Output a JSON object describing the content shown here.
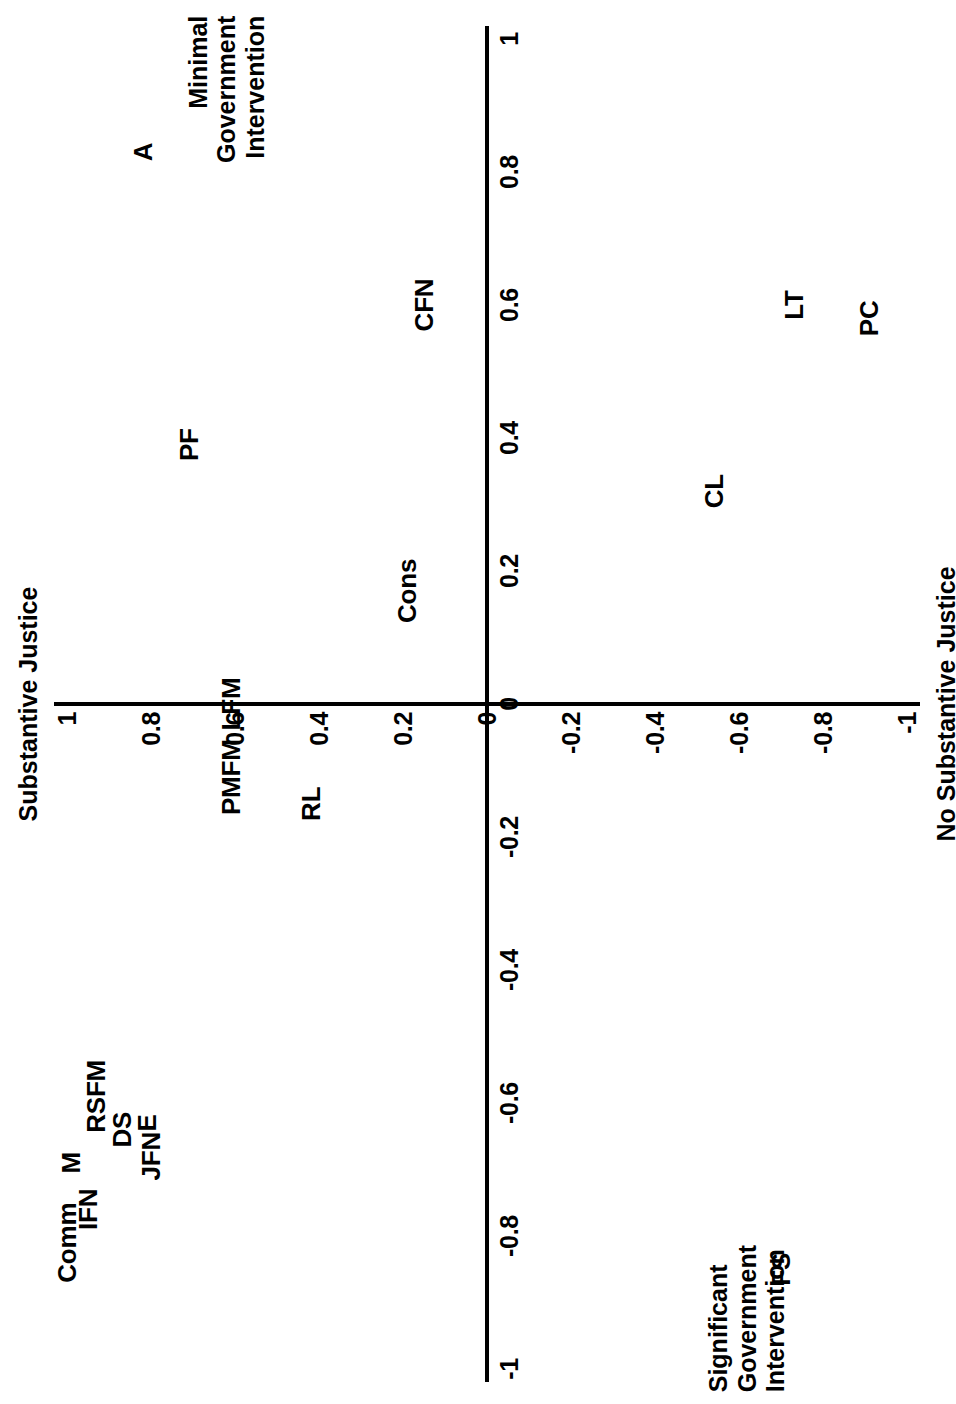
{
  "chart_data": {
    "type": "scatter",
    "title": "",
    "xlabel": "Government Intervention",
    "ylabel": "Substantive Justice",
    "xlim": [
      -1,
      1
    ],
    "ylim": [
      -1,
      1
    ],
    "grid": false,
    "legend": "none",
    "orientation": "page rotated 90 degrees counter-clockwise",
    "axis_titles": {
      "y_positive": "Substantive Justice",
      "y_negative": "No Substantive Justice",
      "x_positive": "Minimal\nGovernment\nIntervention",
      "x_negative": "Significant\nGovernment\nIntervention"
    },
    "x_ticks": [
      "-1",
      "-0.8",
      "-0.6",
      "-0.4",
      "-0.2",
      "0",
      "0.2",
      "0.4",
      "0.6",
      "0.8",
      "1"
    ],
    "x_tick_values": [
      -1,
      -0.8,
      -0.6,
      -0.4,
      -0.2,
      0,
      0.2,
      0.4,
      0.6,
      0.8,
      1
    ],
    "y_ticks": [
      "1",
      "0.8",
      "0.6",
      "0.4",
      "0.2",
      "0",
      "-0.2",
      "-0.4",
      "-0.6",
      "-0.8",
      "-1"
    ],
    "y_tick_values": [
      1,
      0.8,
      0.6,
      0.4,
      0.2,
      0,
      -0.2,
      -0.4,
      -0.6,
      -0.8,
      -1
    ],
    "points": [
      {
        "label": "A",
        "x": 0.83,
        "y": 0.82
      },
      {
        "label": "CFN",
        "x": 0.6,
        "y": 0.15
      },
      {
        "label": "LT",
        "x": 0.6,
        "y": -0.73
      },
      {
        "label": "PC",
        "x": 0.58,
        "y": -0.91
      },
      {
        "label": "PF",
        "x": 0.39,
        "y": 0.71
      },
      {
        "label": "CL",
        "x": 0.32,
        "y": -0.54
      },
      {
        "label": "Cons",
        "x": 0.17,
        "y": 0.19
      },
      {
        "label": "LFM",
        "x": 0.0,
        "y": 0.61
      },
      {
        "label": "PMFM",
        "x": -0.11,
        "y": 0.61
      },
      {
        "label": "RL",
        "x": -0.15,
        "y": 0.42
      },
      {
        "label": "RSFM",
        "x": -0.59,
        "y": 0.93
      },
      {
        "label": "E",
        "x": -0.63,
        "y": 0.81
      },
      {
        "label": "DS",
        "x": -0.64,
        "y": 0.87
      },
      {
        "label": "M",
        "x": -0.69,
        "y": 0.99
      },
      {
        "label": "JFN",
        "x": -0.68,
        "y": 0.8
      },
      {
        "label": "IFN",
        "x": -0.76,
        "y": 0.95
      },
      {
        "label": "Comm",
        "x": -0.81,
        "y": 1.0
      },
      {
        "label": "FS",
        "x": -0.85,
        "y": -0.7
      }
    ]
  }
}
